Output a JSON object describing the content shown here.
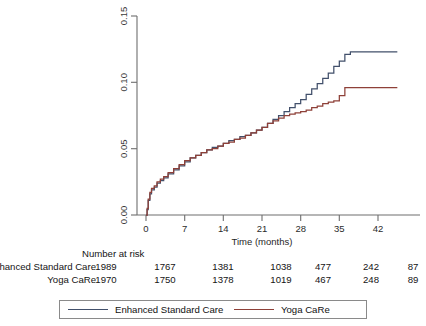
{
  "chart_data": {
    "type": "line",
    "title": "",
    "subtitle": "",
    "xlabel": "Time (months)",
    "ylabel": "",
    "xlim": [
      0,
      46
    ],
    "ylim": [
      0,
      0.15
    ],
    "grid": false,
    "legend_position": "bottom",
    "x_ticks": [
      0,
      7,
      14,
      21,
      28,
      35,
      42
    ],
    "x_tick_labels": [
      "0",
      "7",
      "14",
      "21",
      "28",
      "35",
      "42"
    ],
    "y_ticks": [
      0.0,
      0.05,
      0.1,
      0.15
    ],
    "y_tick_labels": [
      "0.00",
      "0.05",
      "0.10",
      "0.15"
    ],
    "curve_style": "step",
    "series": [
      {
        "name": "Enhanced Standard Care",
        "color": "#42506b",
        "points": [
          [
            0.0,
            0.0
          ],
          [
            0.2,
            0.004
          ],
          [
            0.4,
            0.011
          ],
          [
            0.7,
            0.016
          ],
          [
            1.0,
            0.019
          ],
          [
            1.5,
            0.021
          ],
          [
            2.0,
            0.024
          ],
          [
            2.6,
            0.026
          ],
          [
            3.2,
            0.028
          ],
          [
            4.0,
            0.031
          ],
          [
            5.0,
            0.034
          ],
          [
            6.0,
            0.037
          ],
          [
            7.0,
            0.04
          ],
          [
            8.0,
            0.043
          ],
          [
            9.0,
            0.045
          ],
          [
            10.0,
            0.047
          ],
          [
            11.0,
            0.049
          ],
          [
            12.0,
            0.051
          ],
          [
            13.0,
            0.052
          ],
          [
            14.0,
            0.054
          ],
          [
            15.0,
            0.056
          ],
          [
            16.0,
            0.057
          ],
          [
            17.0,
            0.059
          ],
          [
            18.0,
            0.06
          ],
          [
            19.0,
            0.062
          ],
          [
            20.0,
            0.064
          ],
          [
            21.0,
            0.066
          ],
          [
            22.0,
            0.069
          ],
          [
            23.0,
            0.072
          ],
          [
            24.0,
            0.075
          ],
          [
            25.0,
            0.078
          ],
          [
            26.0,
            0.081
          ],
          [
            27.0,
            0.084
          ],
          [
            28.0,
            0.087
          ],
          [
            29.0,
            0.091
          ],
          [
            30.0,
            0.095
          ],
          [
            31.0,
            0.099
          ],
          [
            32.0,
            0.103
          ],
          [
            33.0,
            0.107
          ],
          [
            34.0,
            0.112
          ],
          [
            35.0,
            0.116
          ],
          [
            36.0,
            0.121
          ],
          [
            37.0,
            0.123
          ],
          [
            38.0,
            0.123
          ],
          [
            42.0,
            0.123
          ],
          [
            45.5,
            0.123
          ]
        ],
        "final_value": 0.123
      },
      {
        "name": "Yoga CaRe",
        "color": "#8e4038",
        "points": [
          [
            0.0,
            0.0
          ],
          [
            0.2,
            0.005
          ],
          [
            0.4,
            0.012
          ],
          [
            0.7,
            0.017
          ],
          [
            1.0,
            0.02
          ],
          [
            1.5,
            0.022
          ],
          [
            2.0,
            0.025
          ],
          [
            2.6,
            0.027
          ],
          [
            3.2,
            0.029
          ],
          [
            4.0,
            0.032
          ],
          [
            5.0,
            0.035
          ],
          [
            6.0,
            0.038
          ],
          [
            7.0,
            0.041
          ],
          [
            8.0,
            0.043
          ],
          [
            9.0,
            0.045
          ],
          [
            10.0,
            0.047
          ],
          [
            11.0,
            0.049
          ],
          [
            12.0,
            0.05
          ],
          [
            13.0,
            0.052
          ],
          [
            14.0,
            0.054
          ],
          [
            15.0,
            0.055
          ],
          [
            16.0,
            0.057
          ],
          [
            17.0,
            0.058
          ],
          [
            18.0,
            0.06
          ],
          [
            19.0,
            0.062
          ],
          [
            20.0,
            0.064
          ],
          [
            21.0,
            0.066
          ],
          [
            22.0,
            0.069
          ],
          [
            23.0,
            0.071
          ],
          [
            24.0,
            0.073
          ],
          [
            25.0,
            0.075
          ],
          [
            26.0,
            0.076
          ],
          [
            27.0,
            0.077
          ],
          [
            28.0,
            0.078
          ],
          [
            29.0,
            0.079
          ],
          [
            30.0,
            0.081
          ],
          [
            31.0,
            0.082
          ],
          [
            32.0,
            0.084
          ],
          [
            33.0,
            0.085
          ],
          [
            34.0,
            0.086
          ],
          [
            35.0,
            0.09
          ],
          [
            36.0,
            0.096
          ],
          [
            37.0,
            0.096
          ],
          [
            38.0,
            0.096
          ],
          [
            42.0,
            0.096
          ],
          [
            45.5,
            0.096
          ]
        ],
        "final_value": 0.096
      }
    ]
  },
  "axis": {
    "x_title": "Time (months)",
    "x_tick_labels": [
      "0",
      "7",
      "14",
      "21",
      "28",
      "35",
      "42"
    ],
    "y_tick_labels": [
      "0.00",
      "0.05",
      "0.10",
      "0.15"
    ]
  },
  "risk_table": {
    "title": "Number at risk",
    "rows": [
      {
        "label": "Enhanced Standard Care",
        "counts": [
          "1989",
          "1767",
          "1381",
          "1038",
          "477",
          "242",
          "87"
        ]
      },
      {
        "label": "Yoga CaRe",
        "counts": [
          "1970",
          "1750",
          "1378",
          "1019",
          "467",
          "248",
          "89"
        ]
      }
    ]
  },
  "legend": {
    "entries": [
      {
        "label": "Enhanced Standard Care",
        "color": "#42506b"
      },
      {
        "label": "Yoga CaRe",
        "color": "#8e4038"
      }
    ]
  }
}
